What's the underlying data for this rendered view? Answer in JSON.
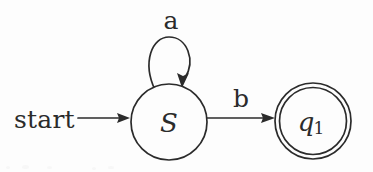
{
  "diagram": {
    "kind": "finite-state-automaton",
    "background_color": "#fdfdfd",
    "ink_color": "#2b2b2b",
    "start_label": "start",
    "states": [
      {
        "id": "S",
        "label": "S",
        "subscript": "",
        "accepting": false,
        "cx": 169,
        "cy": 122,
        "r": 38
      },
      {
        "id": "q1",
        "label": "q",
        "subscript": "1",
        "accepting": true,
        "cx": 313,
        "cy": 121,
        "r": 38
      }
    ],
    "transitions": [
      {
        "from": "S",
        "to": "S",
        "symbol": "a",
        "kind": "self-loop",
        "label_x": 171,
        "label_y": 29
      },
      {
        "from": "S",
        "to": "q1",
        "symbol": "b",
        "kind": "straight",
        "label_x": 241,
        "label_y": 107
      }
    ]
  }
}
